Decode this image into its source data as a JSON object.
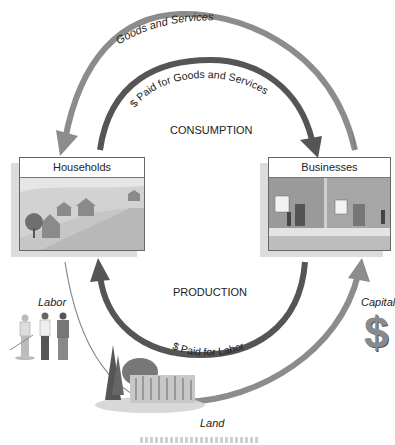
{
  "diagram": {
    "outer_top_flow": "Goods and Services",
    "inner_top_flow": "$ Paid for Goods and Services",
    "top_section": "CONSUMPTION",
    "bottom_section": "PRODUCTION",
    "inner_bottom_flow": "$ Paid for Labor",
    "nodes": {
      "households": "Households",
      "businesses": "Businesses"
    },
    "resources": {
      "labor": "Labor",
      "capital": "Capital",
      "capital_symbol": "$",
      "land": "Land"
    },
    "colors": {
      "arrow_light": "#8c8c8c",
      "arrow_dark": "#555555",
      "border": "#666666"
    }
  }
}
